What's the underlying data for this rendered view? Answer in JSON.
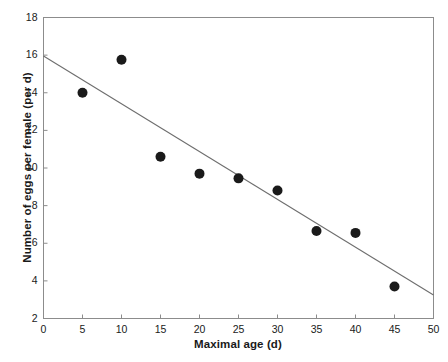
{
  "chart_data": {
    "type": "scatter",
    "title": "",
    "xlabel": "Maximal age (d)",
    "ylabel": "Number of eggs per female (per d)",
    "xlim": [
      0,
      50
    ],
    "ylim": [
      2,
      18
    ],
    "xticks": [
      0,
      5,
      10,
      15,
      20,
      25,
      30,
      35,
      40,
      45,
      50
    ],
    "xtick_labels": [
      "0",
      "5",
      "10",
      "15",
      "20",
      "25",
      "30",
      "35",
      "40",
      "45",
      "50"
    ],
    "yticks": [
      2,
      4,
      6,
      8,
      10,
      12,
      14,
      16,
      18
    ],
    "ytick_labels": [
      "2",
      "4",
      "6",
      "8",
      "10",
      "12",
      "14",
      "16",
      "18"
    ],
    "grid": false,
    "legend": null,
    "frame": "box",
    "marker": {
      "shape": "circle",
      "color": "#1a1a1a",
      "size": 5
    },
    "x": [
      5,
      10,
      15,
      20,
      25,
      30,
      35,
      40,
      45
    ],
    "y": [
      14.0,
      15.75,
      10.6,
      9.7,
      9.45,
      8.8,
      6.65,
      6.55,
      3.7
    ],
    "points": [
      {
        "x": 5,
        "y": 14.0
      },
      {
        "x": 10,
        "y": 15.75
      },
      {
        "x": 15,
        "y": 10.6
      },
      {
        "x": 20,
        "y": 9.7
      },
      {
        "x": 25,
        "y": 9.45
      },
      {
        "x": 30,
        "y": 8.8
      },
      {
        "x": 35,
        "y": 6.65
      },
      {
        "x": 40,
        "y": 6.55
      },
      {
        "x": 45,
        "y": 3.7
      }
    ],
    "trendline": {
      "type": "linear",
      "color": "#6e6e6e",
      "x0": 0,
      "y0": 15.95,
      "x1": 50,
      "y1": 3.25,
      "slope": -0.254,
      "intercept": 15.95
    },
    "axis_color": "#8c8c8c",
    "text_color": "#1a1a1a"
  }
}
